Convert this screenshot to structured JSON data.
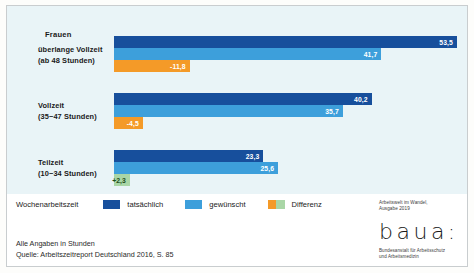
{
  "chart_data": {
    "type": "bar",
    "orientation": "horizontal",
    "title": "Frauen",
    "categories": [
      "überlange Vollzeit (ab 48 Stunden)",
      "Vollzeit (35−47 Stunden)",
      "Teilzeit (10−34 Stunden)"
    ],
    "series": [
      {
        "name": "tatsächlich",
        "values": [
          53.5,
          40.2,
          23.3
        ],
        "color": "#174f9c"
      },
      {
        "name": "gewünscht",
        "values": [
          41.7,
          35.7,
          25.6
        ],
        "color": "#3d9fdb"
      },
      {
        "name": "Differenz",
        "values": [
          -11.8,
          -4.5,
          2.3
        ],
        "color_negative": "#f49a28",
        "color_positive": "#a9d6a6"
      }
    ],
    "value_labels": [
      [
        "53,5",
        "41,7",
        "-11,8"
      ],
      [
        "40,2",
        "35,7",
        "-4,5"
      ],
      [
        "23,3",
        "25,6",
        "+2,3"
      ]
    ],
    "xlabel": "",
    "ylabel": "",
    "xlim": [
      0,
      57
    ],
    "grid": false,
    "legend_position": "bottom",
    "unit_note": "Alle Angaben in Stunden"
  },
  "chart": {
    "title": "Frauen",
    "groups": [
      {
        "label_main": "überlange Vollzeit",
        "label_sub": "(ab 48 Stunden)",
        "bars": [
          {
            "series": "tatsächlich",
            "value": 53.5,
            "label": "53,5",
            "style": "actual"
          },
          {
            "series": "gewünscht",
            "value": 41.7,
            "label": "41,7",
            "style": "desired"
          },
          {
            "series": "Differenz",
            "value": -11.8,
            "label": "-11,8",
            "style": "diff-neg"
          }
        ]
      },
      {
        "label_main": "Vollzeit",
        "label_sub": "(35−47 Stunden)",
        "bars": [
          {
            "series": "tatsächlich",
            "value": 40.2,
            "label": "40,2",
            "style": "actual"
          },
          {
            "series": "gewünscht",
            "value": 35.7,
            "label": "35,7",
            "style": "desired"
          },
          {
            "series": "Differenz",
            "value": -4.5,
            "label": "-4,5",
            "style": "diff-neg"
          }
        ]
      },
      {
        "label_main": "Teilzeit",
        "label_sub": "(10−34 Stunden)",
        "bars": [
          {
            "series": "tatsächlich",
            "value": 23.3,
            "label": "23,3",
            "style": "actual"
          },
          {
            "series": "gewünscht",
            "value": 25.6,
            "label": "25,6",
            "style": "desired"
          },
          {
            "series": "Differenz",
            "value": 2.3,
            "label": "+2,3",
            "style": "diff-pos"
          }
        ]
      }
    ]
  },
  "legend": {
    "title": "Wochenarbeitszeit",
    "items": [
      {
        "label": "tatsächlich",
        "swatch": "solid",
        "color": "#174f9c"
      },
      {
        "label": "gewünscht",
        "swatch": "solid",
        "color": "#3d9fdb"
      },
      {
        "label": "Differenz",
        "swatch": "split",
        "color_left": "#f49a28",
        "color_right": "#a9d6a6"
      }
    ]
  },
  "footnote": {
    "line1": "Alle Angaben in Stunden",
    "line2": "Quelle: Arbeitszeitreport Deutschland 2016, S. 85"
  },
  "credit": {
    "edition_line1": "Arbeitswelt im Wandel,",
    "edition_line2": "Ausgabe 2019",
    "logo_wordmark": "baua:",
    "logo_sub_line1": "Bundesanstalt für Arbeitsschutz",
    "logo_sub_line2": "und Arbeitsmedizin"
  },
  "colors": {
    "actual": "#174f9c",
    "desired": "#3d9fdb",
    "difference_negative": "#f49a28",
    "difference_positive": "#a9d6a6",
    "panel_background": "#e9f4f7"
  }
}
